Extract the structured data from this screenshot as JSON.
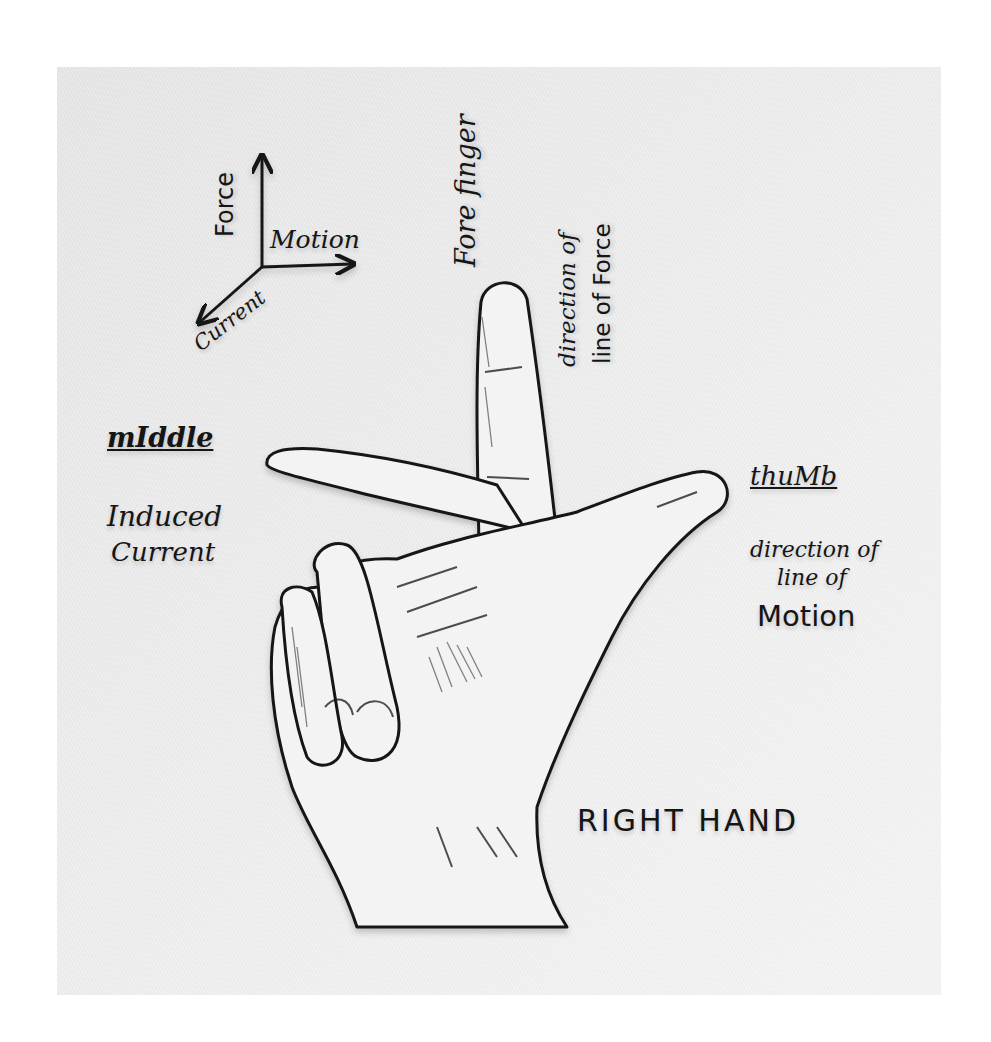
{
  "diagram": {
    "title": "RIGHT HAND",
    "axes_key": {
      "force": "Force",
      "motion": "Motion",
      "current": "Current"
    },
    "forefinger": {
      "name": "Fore finger",
      "meaning_line1": "direction of",
      "meaning_line2": "line of Force",
      "arrow_direction": "up"
    },
    "middle": {
      "name": "mIddle",
      "meaning_line1": "Induced",
      "meaning_line2": "Current",
      "arrow_direction": "left"
    },
    "thumb": {
      "name": "thuMb",
      "meaning_line1": "direction of",
      "meaning_line2": "line of",
      "meaning_line3": "Motion",
      "arrow_direction": "right"
    },
    "colors": {
      "ink": "#151515",
      "paper": "#eeeeee",
      "background": "#ffffff"
    }
  }
}
